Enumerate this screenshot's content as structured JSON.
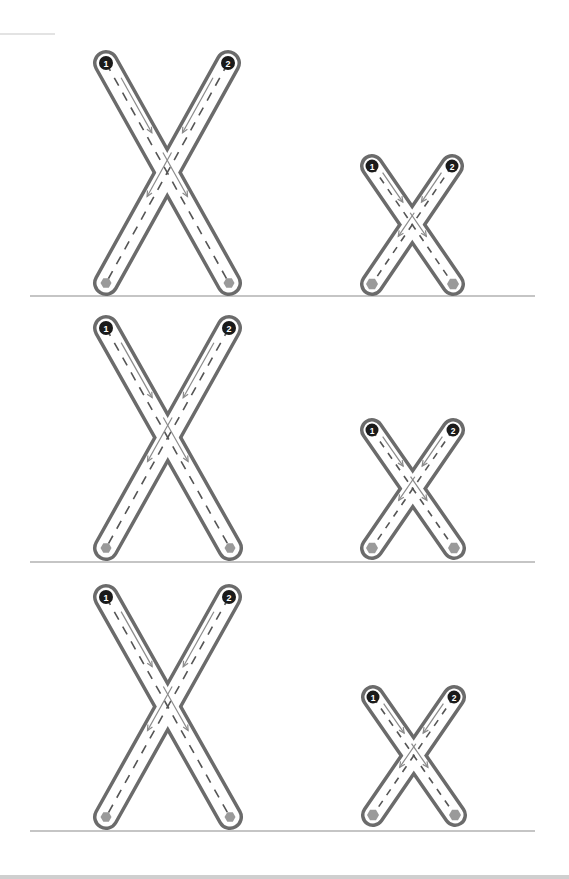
{
  "worksheet": {
    "letter_upper": "X",
    "letter_lower": "x",
    "colors": {
      "outline": "#6b6b6b",
      "tube_fill": "#ffffff",
      "guide_dash": "#555555",
      "arrow": "#8a8a8a",
      "start_dot": "#1a1a1a",
      "start_text": "#ffffff",
      "end_dot": "#9a9a9a",
      "baseline": "#8c8c8c",
      "header_line": "#c8c8c8"
    },
    "stroke_labels": [
      "1",
      "2"
    ],
    "header_line": {
      "x1": 0,
      "x2": 55,
      "y": 34
    },
    "rows": [
      {
        "baseline_y": 296,
        "upper": {
          "tl": [
            106,
            63
          ],
          "tr": [
            228,
            63
          ],
          "bl": [
            106,
            283
          ],
          "br": [
            229,
            283
          ]
        },
        "lower": {
          "tl": [
            372,
            166
          ],
          "tr": [
            452,
            166
          ],
          "bl": [
            372,
            284
          ],
          "br": [
            453,
            284
          ]
        }
      },
      {
        "baseline_y": 562,
        "upper": {
          "tl": [
            106,
            328
          ],
          "tr": [
            229,
            328
          ],
          "bl": [
            106,
            548
          ],
          "br": [
            230,
            548
          ]
        },
        "lower": {
          "tl": [
            372,
            430
          ],
          "tr": [
            453,
            430
          ],
          "bl": [
            372,
            548
          ],
          "br": [
            454,
            548
          ]
        }
      },
      {
        "baseline_y": 831,
        "upper": {
          "tl": [
            106,
            597
          ],
          "tr": [
            229,
            597
          ],
          "bl": [
            106,
            817
          ],
          "br": [
            230,
            817
          ]
        },
        "lower": {
          "tl": [
            373,
            697
          ],
          "tr": [
            454,
            697
          ],
          "bl": [
            373,
            815
          ],
          "br": [
            455,
            815
          ]
        }
      }
    ],
    "baseline_x": [
      30,
      535
    ]
  }
}
